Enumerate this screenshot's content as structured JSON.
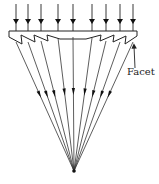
{
  "diagram": {
    "labels": {
      "facet": "Facet"
    },
    "colors": {
      "stroke": "#222222",
      "background": "#ffffff"
    },
    "incoming_ray_x": [
      16,
      28,
      41,
      58,
      73,
      92,
      106,
      120,
      133
    ],
    "incoming_ray_top_y": 4,
    "incoming_arrow_y": 19,
    "lens_top_y": 31,
    "lens_left_x": 9,
    "lens_right_x": 137,
    "exit_ray_x": [
      16,
      28,
      41,
      58,
      73,
      92,
      106,
      120,
      133
    ],
    "exit_y": [
      42,
      42,
      41,
      38,
      37,
      38,
      41,
      42,
      42
    ],
    "focal_point": {
      "x": 74,
      "y": 171
    },
    "pointer": {
      "from": {
        "x": 135,
        "y": 68
      },
      "to": {
        "x": 134,
        "y": 46
      }
    }
  }
}
